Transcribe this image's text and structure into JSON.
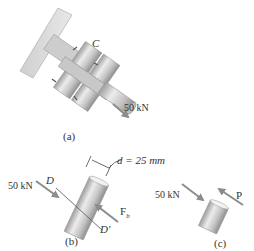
{
  "figure": {
    "panels": [
      {
        "id": "a",
        "caption": "(a)",
        "labels": {
          "connection": "C",
          "force": "50 kN"
        }
      },
      {
        "id": "b",
        "caption": "(b)",
        "labels": {
          "force_left": "50 kN",
          "section_top": "D",
          "section_bottom": "D′",
          "diameter": "d = 25 mm",
          "reaction_force": "F",
          "reaction_subscript": "b"
        }
      },
      {
        "id": "c",
        "caption": "(c)",
        "labels": {
          "force_left": "50 kN",
          "internal_force": "P"
        }
      }
    ],
    "colors": {
      "plate": "#d9d9d9",
      "metal_light": "#e6e6e6",
      "metal_dark": "#a8a8a8",
      "arrow": "#8c8c8c",
      "text": "#333333"
    }
  }
}
